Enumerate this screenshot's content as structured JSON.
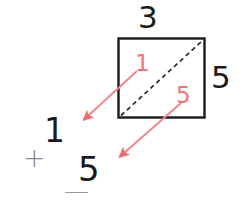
{
  "figure": {
    "background_color": "#ffffff",
    "width": 248,
    "height": 208
  },
  "colors": {
    "outline": "#1a1a1a",
    "diagonal": "#1a1a1a",
    "vector": "#f2737a",
    "muted": "#8c8c8c"
  },
  "shape": {
    "name": "rectangle",
    "top_label": "3",
    "right_label": "5",
    "diagonal_style": "dashed"
  },
  "vectors": [
    {
      "label": "1",
      "color": "#f2737a",
      "direction": "down-left",
      "from": "top-right",
      "to": "bottom-left"
    },
    {
      "label": "5",
      "color": "#f2737a",
      "direction": "down-left",
      "from": "top-right",
      "to": "bottom-left"
    }
  ],
  "expression": {
    "first_term": "1",
    "operator": "+",
    "second_term": "5",
    "rule_line": "—"
  }
}
